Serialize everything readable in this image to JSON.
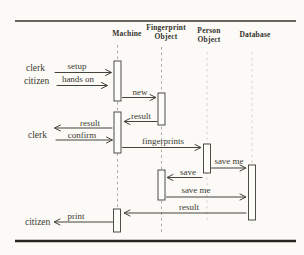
{
  "diagram": {
    "type": "uml-sequence-diagram",
    "columns": [
      {
        "label": "Machine"
      },
      {
        "label": "Fingerprint Object"
      },
      {
        "label": "Person Object"
      },
      {
        "label": "Database"
      }
    ],
    "actors": [
      {
        "label": "clerk"
      },
      {
        "label": "citizen"
      },
      {
        "label": "clerk"
      },
      {
        "label": "citizen"
      }
    ],
    "messages": [
      {
        "label": "setup",
        "from": "clerk",
        "to": "Machine",
        "direction": "right"
      },
      {
        "label": "hands on",
        "from": "citizen",
        "to": "Machine",
        "direction": "right"
      },
      {
        "label": "new",
        "from": "Machine",
        "to": "Fingerprint Object",
        "direction": "right"
      },
      {
        "label": "result",
        "from": "Fingerprint Object",
        "to": "Machine",
        "direction": "left"
      },
      {
        "label": "result",
        "from": "Machine",
        "to": "clerk",
        "direction": "left"
      },
      {
        "label": "confirm",
        "from": "clerk",
        "to": "Machine",
        "direction": "right"
      },
      {
        "label": "fingerprints",
        "from": "Machine",
        "to": "Person Object",
        "direction": "right"
      },
      {
        "label": "save me",
        "from": "Person Object",
        "to": "Database",
        "direction": "right"
      },
      {
        "label": "save",
        "from": "Person Object",
        "to": "Fingerprint Object",
        "direction": "left"
      },
      {
        "label": "save me",
        "from": "Fingerprint Object",
        "to": "Database",
        "direction": "right"
      },
      {
        "label": "result",
        "from": "Database",
        "to": "Machine",
        "direction": "left"
      },
      {
        "label": "print",
        "from": "Machine",
        "to": "citizen",
        "direction": "left"
      }
    ],
    "colors": {
      "background": "#fbfaf7",
      "ink": "#3b3a32",
      "rule": "#2c2b25",
      "lifeline": "#a9a89f"
    }
  }
}
